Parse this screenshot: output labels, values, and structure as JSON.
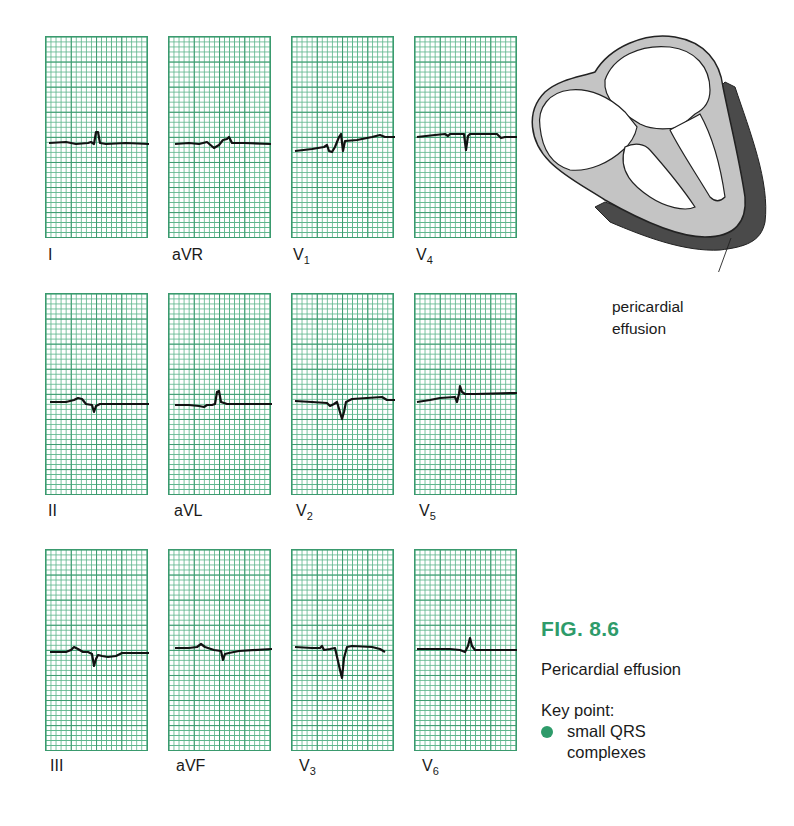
{
  "figure": {
    "number": "FIG. 8.6",
    "title": "Pericardial effusion",
    "key_point_label": "Key point:",
    "key_points": [
      {
        "line1": "small QRS",
        "line2": "complexes"
      }
    ],
    "accent_color": "#2e9b6a",
    "grid_color": "#3a9a6e"
  },
  "diagram": {
    "callout_line1": "pericardial",
    "callout_line2": "effusion"
  },
  "leads": [
    {
      "name": "I",
      "sub": "",
      "row": 0,
      "col": 0
    },
    {
      "name": "aVR",
      "sub": "",
      "row": 0,
      "col": 1
    },
    {
      "name": "V",
      "sub": "1",
      "row": 0,
      "col": 2
    },
    {
      "name": "V",
      "sub": "4",
      "row": 0,
      "col": 3
    },
    {
      "name": "II",
      "sub": "",
      "row": 1,
      "col": 0
    },
    {
      "name": "aVL",
      "sub": "",
      "row": 1,
      "col": 1
    },
    {
      "name": "V",
      "sub": "2",
      "row": 1,
      "col": 2
    },
    {
      "name": "V",
      "sub": "5",
      "row": 1,
      "col": 3
    },
    {
      "name": "III",
      "sub": "",
      "row": 2,
      "col": 0
    },
    {
      "name": "aVF",
      "sub": "",
      "row": 2,
      "col": 1
    },
    {
      "name": "V",
      "sub": "3",
      "row": 2,
      "col": 2
    },
    {
      "name": "V",
      "sub": "6",
      "row": 2,
      "col": 3
    }
  ]
}
